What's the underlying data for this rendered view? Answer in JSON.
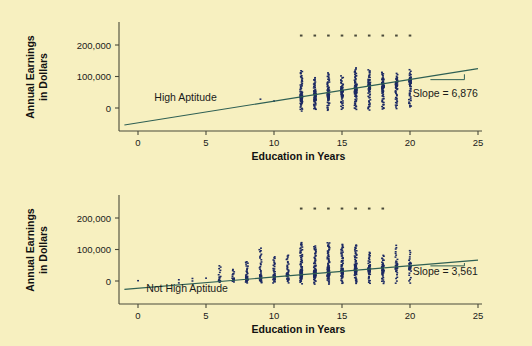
{
  "figure": {
    "background_color": "#f7f0c0",
    "panel_count": 2
  },
  "chart_data": [
    {
      "type": "scatter",
      "title": "",
      "group_label": "High Aptitude",
      "xlabel": "Education in Years",
      "ylabel": "Annual Earnings in Dollars",
      "ylabel_line1": "Annual Earnings",
      "ylabel_line2": "in Dollars",
      "xticks": [
        0,
        5,
        10,
        15,
        20,
        25
      ],
      "xticklabels": [
        "0",
        "5",
        "10",
        "15",
        "20",
        "25"
      ],
      "yticks": [
        0,
        100000,
        200000
      ],
      "yticklabels": [
        "0",
        "100,000",
        "200,000"
      ],
      "xlim": [
        -1,
        25.5
      ],
      "ylim": [
        -55000,
        245000
      ],
      "grid": false,
      "legend": "none",
      "annotation": "Slope = 6,876",
      "slope": 6876,
      "intercept": -47000,
      "regression_line": {
        "x1": -1,
        "y1": -53876,
        "x2": 25,
        "y2": 124900
      },
      "slope_triangle": {
        "x_left": 21.5,
        "x_right": 24.0,
        "y_base": 90000,
        "y_top": 107000
      },
      "topcoded_value": 230000,
      "topcoded_x": [
        12,
        13,
        14,
        15,
        16,
        17,
        18,
        19,
        20
      ],
      "sparse_points": [
        {
          "x": 9,
          "y": 28000
        },
        {
          "x": 10,
          "y": 22000
        }
      ],
      "columns": [
        {
          "x": 12,
          "n": 46,
          "ymin": -8000,
          "ymax": 118000,
          "ycenter": 33000,
          "spread": 33000
        },
        {
          "x": 13,
          "n": 40,
          "ymin": -6000,
          "ymax": 96000,
          "ycenter": 39000,
          "spread": 29000
        },
        {
          "x": 14,
          "n": 42,
          "ymin": -6000,
          "ymax": 110000,
          "ycenter": 45000,
          "spread": 31000
        },
        {
          "x": 15,
          "n": 34,
          "ymin": -4000,
          "ymax": 100000,
          "ycenter": 52000,
          "spread": 28000
        },
        {
          "x": 16,
          "n": 48,
          "ymin": -6000,
          "ymax": 126000,
          "ycenter": 59000,
          "spread": 36000
        },
        {
          "x": 17,
          "n": 40,
          "ymin": -5000,
          "ymax": 122000,
          "ycenter": 66000,
          "spread": 34000
        },
        {
          "x": 18,
          "n": 38,
          "ymin": -4000,
          "ymax": 114000,
          "ycenter": 72000,
          "spread": 33000
        },
        {
          "x": 19,
          "n": 32,
          "ymin": 0,
          "ymax": 108000,
          "ycenter": 79000,
          "spread": 30000
        },
        {
          "x": 20,
          "n": 34,
          "ymin": 2000,
          "ymax": 120000,
          "ycenter": 86000,
          "spread": 32000
        }
      ]
    },
    {
      "type": "scatter",
      "title": "",
      "group_label": "Not High Aptitude",
      "xlabel": "Education in Years",
      "ylabel": "Annual Earnings in Dollars",
      "ylabel_line1": "Annual Earnings",
      "ylabel_line2": "in Dollars",
      "xticks": [
        0,
        5,
        10,
        15,
        20,
        25
      ],
      "xticklabels": [
        "0",
        "5",
        "10",
        "15",
        "20",
        "25"
      ],
      "yticks": [
        0,
        100000,
        200000
      ],
      "yticklabels": [
        "0",
        "100,000",
        "200,000"
      ],
      "xlim": [
        -1,
        25.5
      ],
      "ylim": [
        -55000,
        245000
      ],
      "grid": false,
      "legend": "none",
      "annotation": "Slope = 3,561",
      "slope": 3561,
      "intercept": -23000,
      "regression_line": {
        "x1": -1,
        "y1": -26561,
        "x2": 25,
        "y2": 66025
      },
      "slope_triangle": {
        "x_left": 21.5,
        "x_right": 24.0,
        "y_base": 48000,
        "y_top": 57000
      },
      "topcoded_value": 230000,
      "topcoded_x": [
        12,
        13,
        14,
        15,
        16,
        17,
        18
      ],
      "sparse_points": [
        {
          "x": 0,
          "y": 1000
        },
        {
          "x": 3,
          "y": 4000
        },
        {
          "x": 3,
          "y": -6000
        },
        {
          "x": 4,
          "y": 8000
        },
        {
          "x": 4,
          "y": 0
        },
        {
          "x": 5,
          "y": 9000
        }
      ],
      "columns": [
        {
          "x": 6,
          "n": 10,
          "ymin": -4000,
          "ymax": 50000,
          "ycenter": 2000,
          "spread": 16000
        },
        {
          "x": 7,
          "n": 12,
          "ymin": -4000,
          "ymax": 36000,
          "ycenter": 3000,
          "spread": 14000
        },
        {
          "x": 8,
          "n": 22,
          "ymin": -6000,
          "ymax": 62000,
          "ycenter": 8000,
          "spread": 20000
        },
        {
          "x": 9,
          "n": 24,
          "ymin": -6000,
          "ymax": 106000,
          "ycenter": 11000,
          "spread": 24000
        },
        {
          "x": 10,
          "n": 24,
          "ymin": -6000,
          "ymax": 78000,
          "ycenter": 14000,
          "spread": 22000
        },
        {
          "x": 11,
          "n": 24,
          "ymin": -6000,
          "ymax": 82000,
          "ycenter": 18000,
          "spread": 23000
        },
        {
          "x": 12,
          "n": 50,
          "ymin": -8000,
          "ymax": 122000,
          "ycenter": 22000,
          "spread": 33000
        },
        {
          "x": 13,
          "n": 44,
          "ymin": -8000,
          "ymax": 112000,
          "ycenter": 25000,
          "spread": 31000
        },
        {
          "x": 14,
          "n": 52,
          "ymin": -8000,
          "ymax": 122000,
          "ycenter": 28000,
          "spread": 34000
        },
        {
          "x": 15,
          "n": 44,
          "ymin": -8000,
          "ymax": 116000,
          "ycenter": 31000,
          "spread": 32000
        },
        {
          "x": 16,
          "n": 46,
          "ymin": -8000,
          "ymax": 116000,
          "ycenter": 35000,
          "spread": 33000
        },
        {
          "x": 17,
          "n": 30,
          "ymin": -8000,
          "ymax": 92000,
          "ycenter": 38000,
          "spread": 27000
        },
        {
          "x": 18,
          "n": 28,
          "ymin": -8000,
          "ymax": 80000,
          "ycenter": 41000,
          "spread": 26000
        },
        {
          "x": 19,
          "n": 20,
          "ymin": -6000,
          "ymax": 112000,
          "ycenter": 45000,
          "spread": 28000
        },
        {
          "x": 20,
          "n": 18,
          "ymin": -6000,
          "ymax": 96000,
          "ycenter": 48000,
          "spread": 26000
        }
      ]
    }
  ]
}
